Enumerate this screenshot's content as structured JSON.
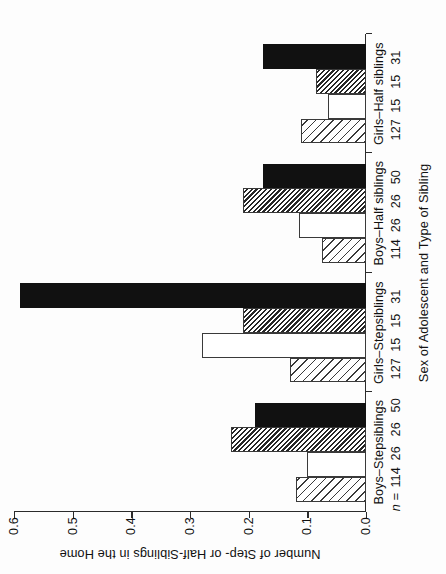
{
  "chart_data": {
    "type": "bar",
    "title": "",
    "xlabel": "Sex of Adolescent and Type of Sibling",
    "ylabel": "Number of Step- or Half-Siblings in the Home",
    "ylim": [
      0.0,
      0.6
    ],
    "ytick_labels": [
      "0.0",
      "0.1",
      "0.2",
      "0.3",
      "0.4",
      "0.5",
      "0.6"
    ],
    "ytick_values": [
      0.0,
      0.1,
      0.2,
      0.3,
      0.4,
      0.5,
      0.6
    ],
    "grid": false,
    "legend_position": "bottom",
    "orientation": "vertical-bars-rotated-90ccw",
    "categories": [
      "Boys–Stepsiblings",
      "Girls–Stepsiblings",
      "Boys–Half siblings",
      "Girls–Half siblings"
    ],
    "n_prefix": "n =",
    "sample_sizes": [
      [
        "114",
        "26",
        "26",
        "50"
      ],
      [
        "127",
        "15",
        "15",
        "31"
      ],
      [
        "114",
        "26",
        "26",
        "50"
      ],
      [
        "127",
        "15",
        "15",
        "31"
      ]
    ],
    "series": [
      {
        "name": "Sole Mother",
        "fill": "diagonal-hatch-light",
        "values": [
          0.12,
          0.13,
          0.075,
          0.11
        ]
      },
      {
        "name": "Dual Mother",
        "fill": "white",
        "values": [
          0.1,
          0.28,
          0.115,
          0.065
        ]
      },
      {
        "name": "Dual Father",
        "fill": "diagonal-hatch-dense",
        "values": [
          0.23,
          0.21,
          0.21,
          0.085
        ]
      },
      {
        "name": "Sole Father",
        "fill": "solid-black",
        "values": [
          0.19,
          0.59,
          0.175,
          0.175
        ]
      }
    ],
    "colors": {
      "axis": "#2b2b2b",
      "bar_outline": "#3a3a3a",
      "solid_black": "#111111",
      "background": "#ffffff"
    }
  }
}
